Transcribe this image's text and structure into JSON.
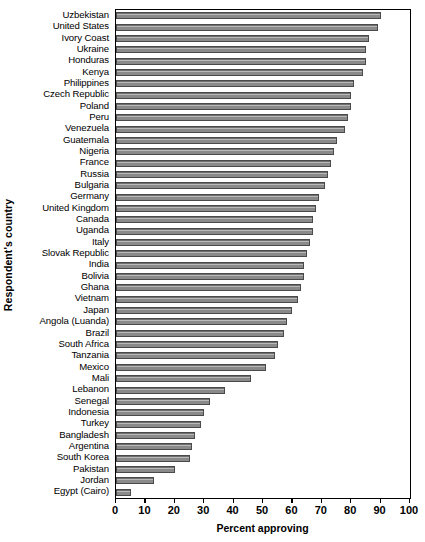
{
  "chart_data": {
    "type": "bar",
    "orientation": "horizontal",
    "title": "",
    "xlabel": "Percent approving",
    "ylabel": "Respondent's country",
    "xlim": [
      0,
      100
    ],
    "xticks": [
      0,
      10,
      20,
      30,
      40,
      50,
      60,
      70,
      80,
      90,
      100
    ],
    "grid": false,
    "legend": null,
    "bar_color": "#8a8a8a",
    "bar_edge_color": "#4a4a4a",
    "categories": [
      "Uzbekistan",
      "United States",
      "Ivory Coast",
      "Ukraine",
      "Honduras",
      "Kenya",
      "Philippines",
      "Czech Republic",
      "Poland",
      "Peru",
      "Venezuela",
      "Guatemala",
      "Nigeria",
      "France",
      "Russia",
      "Bulgaria",
      "Germany",
      "United Kingdom",
      "Canada",
      "Uganda",
      "Italy",
      "Slovak Republic",
      "India",
      "Bolivia",
      "Ghana",
      "Vietnam",
      "Japan",
      "Angola (Luanda)",
      "Brazil",
      "South Africa",
      "Tanzania",
      "Mexico",
      "Mali",
      "Lebanon",
      "Senegal",
      "Indonesia",
      "Turkey",
      "Bangladesh",
      "Argentina",
      "South Korea",
      "Pakistan",
      "Jordan",
      "Egypt (Cairo)"
    ],
    "values": [
      90,
      89,
      86,
      85,
      85,
      84,
      81,
      80,
      80,
      79,
      78,
      75,
      74,
      73,
      72,
      71,
      69,
      68,
      67,
      67,
      66,
      65,
      64,
      64,
      63,
      62,
      60,
      58,
      57,
      55,
      54,
      51,
      46,
      37,
      32,
      30,
      29,
      27,
      26,
      25,
      20,
      13,
      5
    ]
  },
  "axis": {
    "x_title": "Percent approving",
    "y_title": "Respondent's country",
    "tick_labels": [
      "0",
      "10",
      "20",
      "30",
      "40",
      "50",
      "60",
      "70",
      "80",
      "90",
      "100"
    ]
  }
}
